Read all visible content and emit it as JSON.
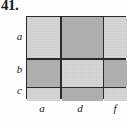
{
  "figure": {
    "exercise_number": "41.",
    "type": "area-model-rectangle-grid",
    "row_labels": [
      {
        "label": "a"
      },
      {
        "label": "b"
      },
      {
        "label": "c"
      }
    ],
    "column_labels": [
      {
        "label": "a"
      },
      {
        "label": "d"
      },
      {
        "label": "f"
      }
    ],
    "colors": {
      "light": "#d9d9d9",
      "dark": "#b3b3b3",
      "line": "#2b2b2b",
      "text": "#1a1a1a",
      "background": "#fdfdfd"
    },
    "cells": [
      {
        "row": "a",
        "col": "a",
        "shade": "light"
      },
      {
        "row": "a",
        "col": "d",
        "shade": "dark"
      },
      {
        "row": "a",
        "col": "f",
        "shade": "light"
      },
      {
        "row": "b",
        "col": "a",
        "shade": "dark"
      },
      {
        "row": "b",
        "col": "d",
        "shade": "light"
      },
      {
        "row": "b",
        "col": "f",
        "shade": "dark"
      },
      {
        "row": "c",
        "col": "a",
        "shade": "light"
      },
      {
        "row": "c",
        "col": "d",
        "shade": "dark"
      },
      {
        "row": "c",
        "col": "f",
        "shade": "light"
      }
    ]
  }
}
